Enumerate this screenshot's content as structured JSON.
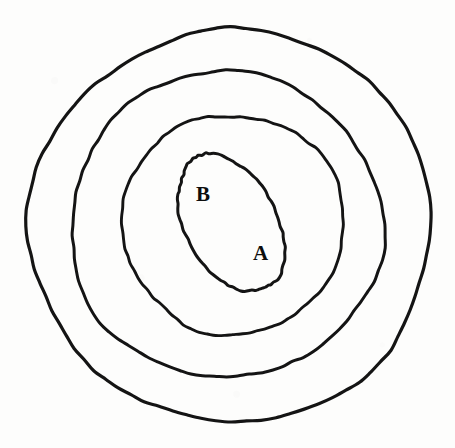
{
  "figure": {
    "kind": "nested-contour-diagram",
    "background_color": "#fdfdfc",
    "stroke_color": "#141414",
    "label_color": "#0d0d0d",
    "width": 455,
    "height": 448
  },
  "labels": [
    {
      "id": "region-b",
      "text": "B",
      "x": 196,
      "y": 184,
      "font_size": 21
    },
    {
      "id": "region-a",
      "text": "A",
      "x": 253,
      "y": 243,
      "font_size": 21
    }
  ],
  "chart_data": {
    "type": "line",
    "title": "",
    "subtitle": "",
    "xlabel": "",
    "ylabel": "",
    "grid": false,
    "legend_position": "none",
    "annotations": [
      "B",
      "A"
    ],
    "series": [
      {
        "name": "contour-1-outermost",
        "level": 1,
        "closed": true,
        "center": [
          231,
          226
        ],
        "radius_x": 201,
        "radius_y": 196,
        "rotation_deg": 0,
        "bbox": [
          30,
          30,
          432,
          422
        ],
        "stroke_width": 3.2
      },
      {
        "name": "contour-2",
        "level": 2,
        "closed": true,
        "center": [
          226,
          225
        ],
        "radius_x": 156,
        "radius_y": 153,
        "rotation_deg": 0,
        "bbox": [
          70,
          72,
          383,
          378
        ],
        "stroke_width": 3.0
      },
      {
        "name": "contour-3",
        "level": 3,
        "closed": true,
        "center": [
          233,
          224
        ],
        "radius_x": 111,
        "radius_y": 110,
        "rotation_deg": 0,
        "bbox": [
          122,
          114,
          345,
          335
        ],
        "stroke_width": 2.9
      },
      {
        "name": "contour-4-innermost",
        "level": 4,
        "closed": true,
        "center": [
          231,
          223
        ],
        "radius_x": 46,
        "radius_y": 74,
        "rotation_deg": -28,
        "bbox": [
          172,
          158,
          290,
          288
        ],
        "stroke_width": 3.0
      }
    ]
  }
}
